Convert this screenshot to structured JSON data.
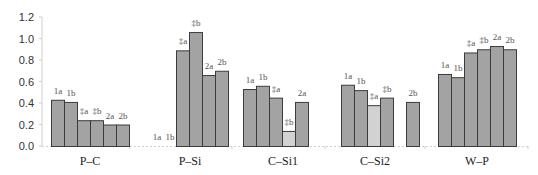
{
  "chart_data": {
    "type": "bar",
    "title": "",
    "xlabel": "",
    "ylabel": "",
    "ylim": [
      0,
      1.2
    ],
    "yticks": [
      "0.0",
      "0.2",
      "0.4",
      "0.6",
      "0.8",
      "1.0",
      "1.2"
    ],
    "ytick_values": [
      0.0,
      0.2,
      0.4,
      0.6,
      0.8,
      1.0,
      1.2
    ],
    "grid": false,
    "legend": "none",
    "colors": {
      "bar": "#a3a3a3",
      "bar_highlight": "#d2d2d2",
      "outline": "#3c3c3c",
      "axis": "#cfcfcf"
    },
    "groups": [
      {
        "name": "P–C",
        "bars": [
          {
            "label": "1a",
            "value": 0.43,
            "highlight": false
          },
          {
            "label": "1b",
            "value": 0.41,
            "highlight": false
          },
          {
            "label": "‡a",
            "value": 0.24,
            "highlight": false
          },
          {
            "label": "‡b",
            "value": 0.24,
            "highlight": false
          },
          {
            "label": "2a",
            "value": 0.2,
            "highlight": false
          },
          {
            "label": "2b",
            "value": 0.2,
            "highlight": false
          }
        ]
      },
      {
        "name": "P–Si",
        "bars": [
          {
            "label": "1a",
            "value": 0.0,
            "highlight": false
          },
          {
            "label": "1b",
            "value": 0.0,
            "highlight": false
          },
          {
            "label": "‡a",
            "value": 0.89,
            "highlight": false
          },
          {
            "label": "‡b",
            "value": 1.06,
            "highlight": false
          },
          {
            "label": "2a",
            "value": 0.66,
            "highlight": false
          },
          {
            "label": "2b",
            "value": 0.7,
            "highlight": false
          }
        ]
      },
      {
        "name": "C–Si1",
        "bars": [
          {
            "label": "1a",
            "value": 0.53,
            "highlight": false
          },
          {
            "label": "1b",
            "value": 0.56,
            "highlight": false
          },
          {
            "label": "‡a",
            "value": 0.45,
            "highlight": false
          },
          {
            "label": "‡b",
            "value": 0.14,
            "highlight": true
          },
          {
            "label": "2a",
            "value": 0.41,
            "highlight": false
          },
          {
            "label": "",
            "value": null,
            "highlight": false
          }
        ]
      },
      {
        "name": "C–Si2",
        "bars": [
          {
            "label": "1a",
            "value": 0.57,
            "highlight": false
          },
          {
            "label": "1b",
            "value": 0.52,
            "highlight": false
          },
          {
            "label": "‡a",
            "value": 0.38,
            "highlight": true
          },
          {
            "label": "‡b",
            "value": 0.45,
            "highlight": false
          },
          {
            "label": "",
            "value": null,
            "highlight": false
          },
          {
            "label": "2b",
            "value": 0.41,
            "highlight": false
          }
        ]
      },
      {
        "name": "W–P",
        "bars": [
          {
            "label": "1a",
            "value": 0.67,
            "highlight": false
          },
          {
            "label": "1b",
            "value": 0.64,
            "highlight": false
          },
          {
            "label": "‡a",
            "value": 0.87,
            "highlight": false
          },
          {
            "label": "‡b",
            "value": 0.9,
            "highlight": false
          },
          {
            "label": "2a",
            "value": 0.93,
            "highlight": false
          },
          {
            "label": "2b",
            "value": 0.9,
            "highlight": false
          }
        ]
      }
    ]
  }
}
